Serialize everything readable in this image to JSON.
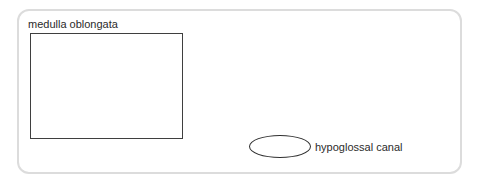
{
  "diagram": {
    "frame": {
      "shape": "rounded-rectangle",
      "border_color": "#dcdcdc"
    },
    "regions": [
      {
        "id": "medulla-oblongata",
        "label": "medulla oblongata",
        "shape": "rectangle",
        "stroke_color": "#3f3f3f"
      },
      {
        "id": "hypoglossal-canal",
        "label": "hypoglossal canal",
        "shape": "ellipse",
        "stroke_color": "#2f2f2f"
      }
    ]
  }
}
